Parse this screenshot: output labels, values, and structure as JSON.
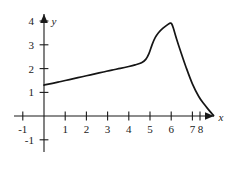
{
  "chart_data": {
    "type": "line",
    "title": "",
    "xlabel": "x",
    "ylabel": "y",
    "xlim": [
      -1.6,
      9.2
    ],
    "ylim": [
      -1.6,
      4.6
    ],
    "xticks": [
      -1,
      1,
      2,
      3,
      4,
      5,
      6,
      7,
      8
    ],
    "yticks": [
      -1,
      1,
      2,
      3,
      4
    ],
    "xtick_labels": [
      "-1",
      "1",
      "2",
      "3",
      "4",
      "5",
      "6",
      "7",
      "8"
    ],
    "ytick_labels": [
      "-1",
      "1",
      "2",
      "3",
      "4"
    ],
    "grid": false,
    "legend": null,
    "axis_arrows": [
      "x-positive",
      "y-positive"
    ],
    "series": [
      {
        "name": "curve",
        "color": "#151515",
        "x": [
          0.0,
          0.4,
          0.8,
          1.2,
          1.6,
          2.0,
          2.4,
          2.8,
          3.2,
          3.6,
          4.0,
          4.3,
          4.6,
          4.8,
          4.95,
          5.1,
          5.25,
          5.4,
          5.6,
          5.8,
          5.95,
          6.02,
          6.1,
          6.25,
          6.45,
          6.7,
          7.0,
          7.3,
          7.55,
          7.75,
          7.9,
          8.0
        ],
        "y": [
          1.3,
          1.37,
          1.45,
          1.53,
          1.61,
          1.69,
          1.77,
          1.85,
          1.93,
          2.0,
          2.08,
          2.15,
          2.24,
          2.38,
          2.62,
          3.0,
          3.3,
          3.5,
          3.68,
          3.82,
          3.9,
          3.88,
          3.7,
          3.25,
          2.7,
          2.05,
          1.35,
          0.82,
          0.5,
          0.28,
          0.12,
          0.02
        ]
      }
    ]
  },
  "axes": {
    "x_axis_label": "x",
    "y_axis_label": "y"
  },
  "geometry": {
    "origin_px": [
      44,
      116
    ],
    "unit_x_px": 21.2,
    "unit_y_px": 23.8
  }
}
